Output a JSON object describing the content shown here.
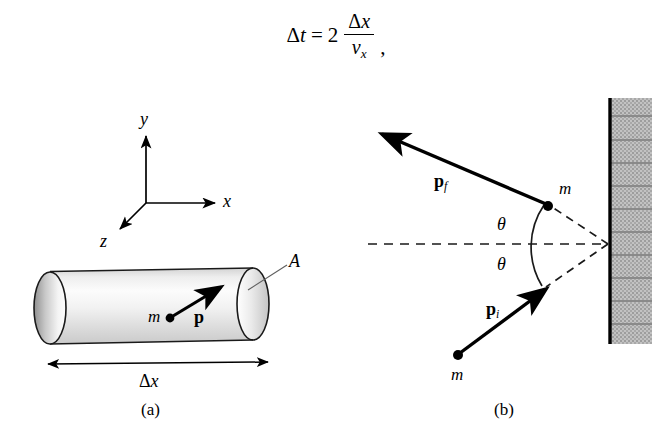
{
  "equation": {
    "lhs_delta": "Δ",
    "lhs_var": "t",
    "equals": "=",
    "coefficient": "2",
    "numerator_delta": "Δ",
    "numerator_var": "x",
    "denominator_var": "v",
    "denominator_sub": "x",
    "trailing_punctuation": ",",
    "plain": "Δt = 2 Δx / vₓ ,"
  },
  "panel_a": {
    "caption": "(a)",
    "axes": {
      "y_label": "y",
      "x_label": "x",
      "z_label": "z"
    },
    "cylinder": {
      "mass_label": "m",
      "momentum_label": "p",
      "area_label": "A",
      "length_delta": "Δ",
      "length_var": "x",
      "length_label": "Δx"
    }
  },
  "panel_b": {
    "caption": "(b)",
    "final_momentum_label": "p",
    "final_momentum_sub": "f",
    "initial_momentum_label": "p",
    "initial_momentum_sub": "i",
    "mass_label_top": "m",
    "mass_label_bottom": "m",
    "angle_label_top": "θ",
    "angle_label_bottom": "θ",
    "wall_name": "wall"
  },
  "colors": {
    "ink": "#000000",
    "background": "#ffffff",
    "cylinder_light": "#fbfbfb",
    "cylinder_mid": "#e3e3e3",
    "cylinder_dark": "#b9b9b9",
    "endcap_shadow": "#9c9c9c",
    "wall_fill": "#b5b5b5",
    "wall_line": "#8e8e8e",
    "leader_line": "#6b6b6b"
  }
}
